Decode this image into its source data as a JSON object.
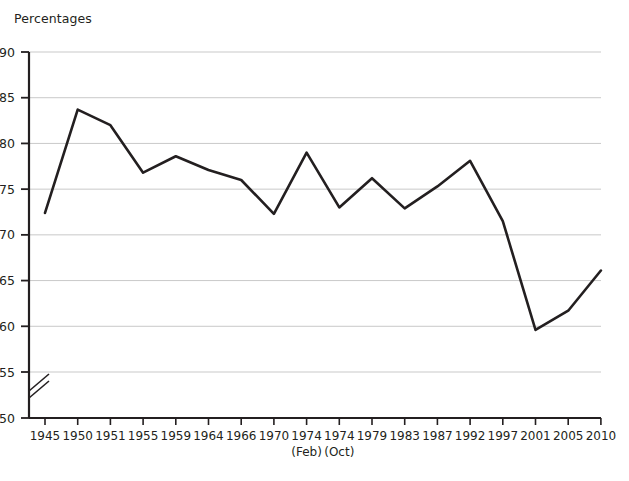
{
  "chart_data": {
    "type": "line",
    "title": "Percentages",
    "xlabel": "",
    "ylabel": "",
    "ylim": [
      50,
      90
    ],
    "y_ticks": [
      50,
      55,
      60,
      65,
      70,
      75,
      80,
      85,
      90
    ],
    "y_axis_break": true,
    "y_axis_break_between": [
      50,
      55
    ],
    "grid": true,
    "grid_axis": "y",
    "legend": "none",
    "line_color": "#231f20",
    "categories": [
      "1945",
      "1950",
      "1951",
      "1955",
      "1959",
      "1964",
      "1966",
      "1970",
      "1974",
      "1974",
      "1979",
      "1983",
      "1987",
      "1992",
      "1997",
      "2001",
      "2005",
      "2010"
    ],
    "category_sublabels": [
      "",
      "",
      "",
      "",
      "",
      "",
      "",
      "",
      "(Feb)",
      "(Oct)",
      "",
      "",
      "",
      "",
      "",
      "",
      "",
      ""
    ],
    "values": [
      72.4,
      83.7,
      82.0,
      76.8,
      78.6,
      77.1,
      76.0,
      72.3,
      79.0,
      73.0,
      76.2,
      72.9,
      75.3,
      78.1,
      71.5,
      59.6,
      61.7,
      66.1
    ]
  },
  "axes": {
    "y_tick_labels": [
      "90",
      "85",
      "80",
      "75",
      "70",
      "65",
      "60",
      "55",
      "50"
    ],
    "x_tick_labels": [
      "1945",
      "1950",
      "1951",
      "1955",
      "1959",
      "1964",
      "1966",
      "1970",
      "1974",
      "1974",
      "1979",
      "1983",
      "1987",
      "1992",
      "1997",
      "2001",
      "2005",
      "2010"
    ],
    "x_sub_labels": [
      "(Feb)",
      "(Oct)"
    ]
  }
}
